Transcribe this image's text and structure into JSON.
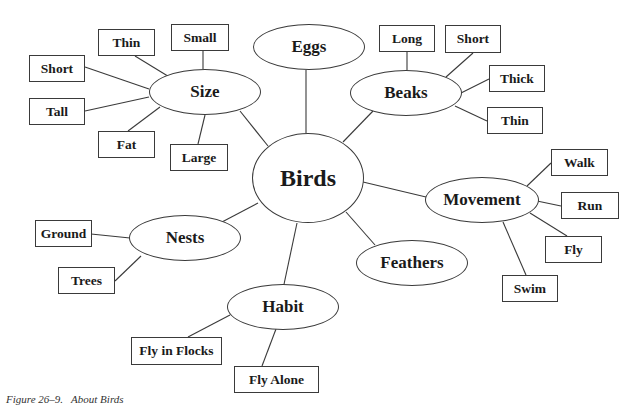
{
  "diagram": {
    "type": "concept-map",
    "center": {
      "label": "Birds"
    },
    "categories": [
      {
        "id": "size",
        "label": "Size",
        "children": [
          "Thin",
          "Small",
          "Short",
          "Tall",
          "Fat",
          "Large"
        ]
      },
      {
        "id": "eggs",
        "label": "Eggs",
        "children": []
      },
      {
        "id": "beaks",
        "label": "Beaks",
        "children": [
          "Long",
          "Short",
          "Thick",
          "Thin"
        ]
      },
      {
        "id": "movement",
        "label": "Movement",
        "children": [
          "Walk",
          "Run",
          "Fly",
          "Swim"
        ]
      },
      {
        "id": "feathers",
        "label": "Feathers",
        "children": []
      },
      {
        "id": "habit",
        "label": "Habit",
        "children": [
          "Fly in Flocks",
          "Fly Alone"
        ]
      },
      {
        "id": "nests",
        "label": "Nests",
        "children": [
          "Ground",
          "Trees"
        ]
      }
    ]
  },
  "labels": {
    "birds": "Birds",
    "size": "Size",
    "eggs": "Eggs",
    "beaks": "Beaks",
    "movement": "Movement",
    "feathers": "Feathers",
    "habit": "Habit",
    "nests": "Nests",
    "size_thin": "Thin",
    "size_small": "Small",
    "size_short": "Short",
    "size_tall": "Tall",
    "size_fat": "Fat",
    "size_large": "Large",
    "beaks_long": "Long",
    "beaks_short": "Short",
    "beaks_thick": "Thick",
    "beaks_thin": "Thin",
    "movement_walk": "Walk",
    "movement_run": "Run",
    "movement_fly": "Fly",
    "movement_swim": "Swim",
    "nests_ground": "Ground",
    "nests_trees": "Trees",
    "habit_flocks": "Fly in Flocks",
    "habit_alone": "Fly Alone"
  },
  "caption": "Figure 26–9.   About Birds"
}
